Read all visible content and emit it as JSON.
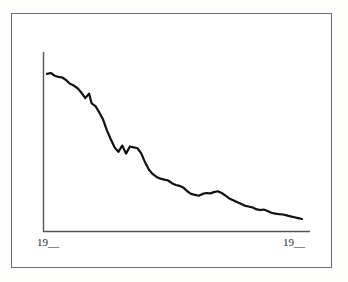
{
  "frame": {
    "border_color": "#6e6e6e",
    "background": "#ffffff"
  },
  "chart_data": {
    "type": "line",
    "title": "",
    "subtitle": "",
    "xlabel": "",
    "ylabel": "",
    "grid": false,
    "legend": null,
    "axis_color": "#555555",
    "line_color": "#111111",
    "line_width": 2.2,
    "xlim": [
      0,
      100
    ],
    "ylim": [
      0,
      100
    ],
    "x_tick_labels": [
      "19__",
      "19__"
    ],
    "y_tick_labels": [],
    "annotations": [],
    "series": [
      {
        "name": "series-1",
        "x": [
          0,
          1.5,
          3.0,
          4.5,
          6.0,
          7.5,
          9.0,
          10.5,
          12.0,
          13.5,
          15.0,
          16.5,
          17.5,
          19.0,
          20.5,
          22.0,
          23.5,
          25.0,
          26.5,
          28.0,
          29.5,
          31.0,
          32.5,
          34.0,
          35.5,
          37.0,
          38.5,
          40.0,
          41.5,
          43.0,
          44.5,
          46.0,
          47.5,
          49.0,
          50.5,
          52.0,
          53.5,
          55.0,
          56.5,
          58.0,
          59.5,
          61.0,
          62.5,
          64.0,
          65.5,
          67.0,
          68.5,
          70.0,
          71.5,
          73.0,
          74.5,
          76.0,
          77.5,
          79.0,
          80.5,
          82.0,
          83.5,
          85.0,
          86.5,
          88.0,
          89.5,
          91.0,
          92.5,
          94.0,
          95.5,
          97.0,
          98.5,
          100.0
        ],
        "y": [
          88.5,
          89.0,
          87.5,
          86.8,
          86.5,
          85.0,
          83.0,
          82.0,
          80.5,
          78.0,
          75.0,
          77.5,
          72.0,
          70.5,
          67.0,
          63.0,
          57.0,
          52.0,
          47.5,
          45.0,
          48.5,
          44.0,
          48.0,
          47.5,
          47.0,
          44.0,
          39.0,
          35.0,
          32.5,
          31.0,
          30.0,
          29.5,
          29.0,
          27.5,
          26.5,
          26.0,
          25.0,
          23.0,
          21.5,
          21.0,
          20.5,
          21.5,
          22.0,
          21.8,
          22.5,
          23.0,
          22.0,
          20.5,
          19.0,
          18.0,
          17.0,
          16.0,
          15.0,
          14.5,
          14.0,
          13.0,
          12.5,
          12.8,
          12.0,
          11.0,
          10.5,
          10.2,
          10.0,
          9.5,
          9.0,
          8.5,
          8.0,
          7.5
        ]
      }
    ]
  },
  "x_axis": {
    "left_label": "19__",
    "right_label": "19__"
  }
}
